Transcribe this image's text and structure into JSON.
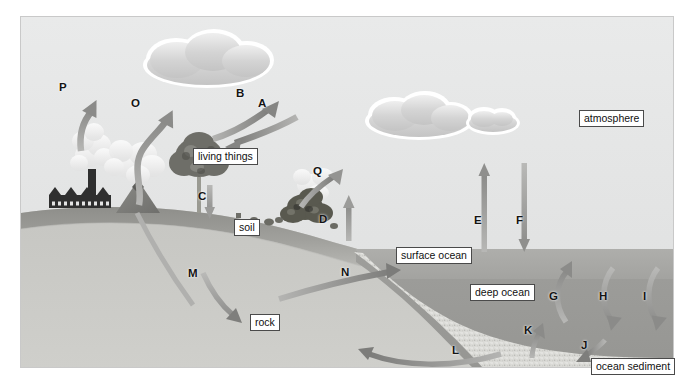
{
  "figure": {
    "title_cropped": "",
    "width": 694,
    "height": 388
  },
  "colors": {
    "sky": "#e7e8e8",
    "soil": "#9a9a96",
    "rock": "#c9c9c5",
    "surface_ocean": "#a9a9a6",
    "deep_ocean": "#9d9d9a",
    "sediment": "#d9d9d5",
    "arrow_dark": "#8a8a88",
    "arrow_mid": "#9b9b99",
    "arrow_light": "#b3b3b1",
    "cloud": "#d2d2d2",
    "label_border": "#4a4a4a",
    "label_bg": "#ffffff",
    "letter": "#141414"
  },
  "reservoir_labels": [
    {
      "id": "living-things",
      "text": "living things",
      "x": 193,
      "y": 148
    },
    {
      "id": "atmosphere",
      "text": "atmosphere",
      "x": 579,
      "y": 110
    },
    {
      "id": "soil",
      "text": "soil",
      "x": 234,
      "y": 219
    },
    {
      "id": "rock",
      "text": "rock",
      "x": 250,
      "y": 314
    },
    {
      "id": "surface-ocean",
      "text": "surface ocean",
      "x": 396,
      "y": 247
    },
    {
      "id": "deep-ocean",
      "text": "deep ocean",
      "x": 470,
      "y": 284
    },
    {
      "id": "ocean-sediment",
      "text": "ocean sediment",
      "x": 591,
      "y": 358
    }
  ],
  "flux_arrows": [
    {
      "letter": "A",
      "x": 258,
      "y": 97,
      "direction": "down-left",
      "from": "atmosphere",
      "to": "living things",
      "description": "photosynthesis uptake into living things"
    },
    {
      "letter": "B",
      "x": 236,
      "y": 87,
      "direction": "up-right",
      "from": "living things",
      "to": "atmosphere",
      "description": "respiration release to atmosphere"
    },
    {
      "letter": "C",
      "x": 198,
      "y": 190,
      "direction": "down",
      "from": "living things",
      "to": "soil",
      "description": "litter and dead matter into soil"
    },
    {
      "letter": "D",
      "x": 319,
      "y": 213,
      "direction": "up",
      "from": "soil",
      "to": "atmosphere",
      "description": "soil respiration to atmosphere"
    },
    {
      "letter": "E",
      "x": 474,
      "y": 214,
      "direction": "up",
      "from": "surface ocean",
      "to": "atmosphere",
      "description": "ocean outgassing to atmosphere"
    },
    {
      "letter": "F",
      "x": 516,
      "y": 214,
      "direction": "down",
      "from": "atmosphere",
      "to": "surface ocean",
      "description": "atmospheric dissolution into ocean"
    },
    {
      "letter": "G",
      "x": 549,
      "y": 290,
      "direction": "arc-up",
      "from": "deep ocean",
      "to": "surface ocean",
      "description": "upwelling from deep ocean"
    },
    {
      "letter": "H",
      "x": 599,
      "y": 290,
      "direction": "arc-down",
      "from": "surface ocean",
      "to": "deep ocean",
      "description": "downwelling into deep ocean"
    },
    {
      "letter": "I",
      "x": 643,
      "y": 290,
      "direction": "arc-down",
      "from": "surface ocean",
      "to": "deep ocean",
      "description": "sinking particulate carbon"
    },
    {
      "letter": "J",
      "x": 581,
      "y": 339,
      "direction": "down-left",
      "from": "deep ocean",
      "to": "ocean sediment",
      "description": "burial into ocean sediment"
    },
    {
      "letter": "K",
      "x": 524,
      "y": 324,
      "direction": "up",
      "from": "ocean sediment",
      "to": "deep ocean",
      "description": "release from sediment to deep ocean"
    },
    {
      "letter": "L",
      "x": 452,
      "y": 344,
      "direction": "left",
      "from": "ocean sediment",
      "to": "rock",
      "description": "sediment compaction into rock"
    },
    {
      "letter": "M",
      "x": 188,
      "y": 267,
      "direction": "down-right",
      "from": "soil",
      "to": "rock",
      "description": "burial of soil carbon into rock"
    },
    {
      "letter": "N",
      "x": 341,
      "y": 266,
      "direction": "right",
      "from": "rock",
      "to": "surface ocean",
      "description": "weathering runoff to surface ocean"
    },
    {
      "letter": "O",
      "x": 131,
      "y": 97,
      "direction": "up-right",
      "from": "rock",
      "to": "atmosphere",
      "description": "volcanic outgassing"
    },
    {
      "letter": "P",
      "x": 59,
      "y": 81,
      "direction": "up",
      "from": "rock",
      "to": "atmosphere",
      "description": "fossil fuel combustion emissions"
    },
    {
      "letter": "Q",
      "x": 313,
      "y": 165,
      "direction": "arc-up",
      "from": "living things",
      "to": "atmosphere",
      "description": "biomass burning emissions"
    }
  ],
  "scene_objects": [
    {
      "id": "factory",
      "name": "factory-with-smokestack",
      "x": 30,
      "y": 150
    },
    {
      "id": "volcano",
      "name": "erupting-volcano",
      "x": 100,
      "y": 150
    },
    {
      "id": "tree",
      "name": "tree",
      "x": 175,
      "y": 130
    },
    {
      "id": "burning-bush",
      "name": "burning-vegetation",
      "x": 280,
      "y": 165
    },
    {
      "id": "cloud-large",
      "name": "cloud",
      "x": 148,
      "y": 28
    },
    {
      "id": "cloud-right",
      "name": "cloud",
      "x": 340,
      "y": 82
    },
    {
      "id": "cloud-small",
      "name": "cloud",
      "x": 440,
      "y": 95
    }
  ]
}
